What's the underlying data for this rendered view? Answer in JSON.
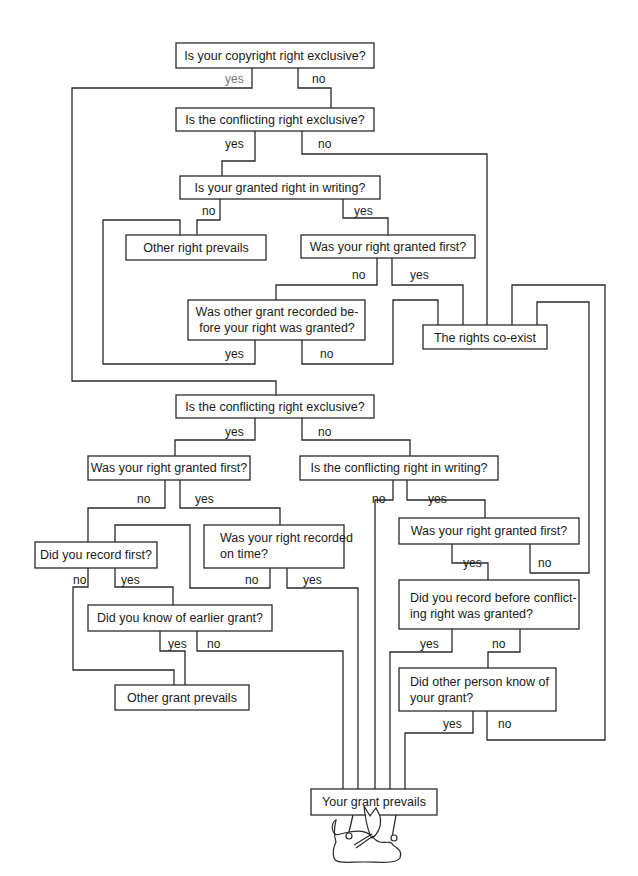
{
  "diagram": {
    "title_fragment": "",
    "nodes": {
      "q1": {
        "lines": [
          "Is your copyright right exclusive?"
        ]
      },
      "q2": {
        "lines": [
          "Is the conflicting right exclusive?"
        ]
      },
      "q3": {
        "lines": [
          "Is your granted right in writing?"
        ]
      },
      "r_other_right": {
        "lines": [
          "Other right prevails"
        ]
      },
      "q4": {
        "lines": [
          "Was your right granted first?"
        ]
      },
      "q5": {
        "lines": [
          "Was other grant recorded be-",
          "fore your right was granted?"
        ]
      },
      "r_coexist": {
        "lines": [
          "The rights co-exist"
        ]
      },
      "q6": {
        "lines": [
          "Is the conflicting right exclusive?"
        ]
      },
      "q7": {
        "lines": [
          "Was your right granted first?"
        ]
      },
      "q8": {
        "lines": [
          "Is the conflicting right in writing?"
        ]
      },
      "q9": {
        "lines": [
          "Did you record first?"
        ]
      },
      "q10": {
        "lines": [
          "Was your right recorded",
          "on time?"
        ]
      },
      "q11": {
        "lines": [
          "Was your right granted first?"
        ]
      },
      "q12": {
        "lines": [
          "Did you know of earlier grant?"
        ]
      },
      "q13": {
        "lines": [
          "Did you record before conflict-",
          "ing right was granted?"
        ]
      },
      "r_other_grant": {
        "lines": [
          "Other grant prevails"
        ]
      },
      "q14": {
        "lines": [
          "Did other person know of",
          "your grant?"
        ]
      },
      "r_your_grant": {
        "lines": [
          "Your grant prevails"
        ]
      }
    },
    "labels": {
      "q1_yes": "yes",
      "q1_no": "no",
      "q2_yes": "yes",
      "q2_no": "no",
      "q3_no": "no",
      "q3_yes": "yes",
      "q4_no": "no",
      "q4_yes": "yes",
      "q5_yes": "yes",
      "q5_no": "no",
      "q6_yes": "yes",
      "q6_no": "no",
      "q7_no": "no",
      "q7_yes": "yes",
      "q8_no": "no",
      "q8_yes": "yes",
      "q9_no": "no",
      "q9_yes": "yes",
      "q10_no": "no",
      "q10_yes": "yes",
      "q11_yes": "yes",
      "q11_no": "no",
      "q12_yes": "yes",
      "q12_no": "no",
      "q13_yes": "yes",
      "q13_no": "no",
      "q14_yes": "yes",
      "q14_no": "no"
    },
    "illustration": "mouse-holding-sign-icon"
  }
}
